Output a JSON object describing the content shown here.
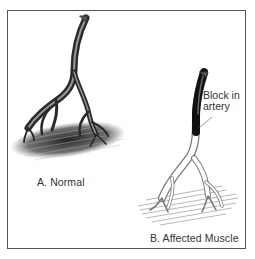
{
  "figure": {
    "panel_a": {
      "label": "A. Normal",
      "vessel_color": "#3a3a3a",
      "muscle_color": "#2b2b2b"
    },
    "panel_b": {
      "label": "B. Affected Muscle",
      "callout_line1": "Block in",
      "callout_line2": "artery",
      "blocked_segment_color": "#111111",
      "vessel_outline_color": "#777777"
    }
  }
}
